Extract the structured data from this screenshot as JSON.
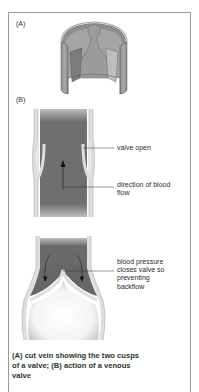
{
  "figure": {
    "panel_a": {
      "label": "(A)"
    },
    "panel_b": {
      "label": "(B)"
    },
    "annotations": {
      "valve_open": "valve open",
      "direction_line1": "direction of blood",
      "direction_line2": "flow",
      "pressure_line1": "blood pressure",
      "pressure_line2": "closes valve so",
      "pressure_line3": "preventing",
      "pressure_line4": "backflow"
    },
    "caption_line1": "(A) cut vein showing the two cusps",
    "caption_line2": "of a valve; (B) action of a venous",
    "caption_line3": "valve"
  },
  "colors": {
    "blood": "#6f6f6f",
    "wall": "#dcdcdc",
    "wall_outline": "#8a8a8a",
    "caption": "#2c362c"
  }
}
